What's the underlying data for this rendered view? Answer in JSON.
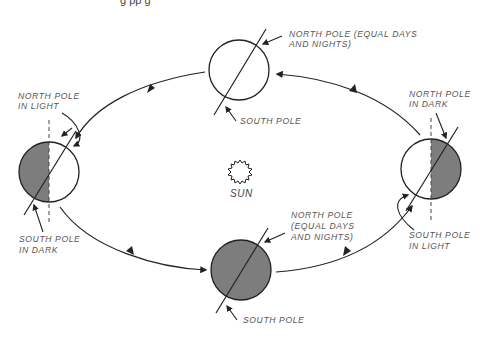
{
  "header": {
    "cut_off_text": "g  pp g"
  },
  "sun": {
    "label": "SUN"
  },
  "positions": {
    "top": {
      "north_label": [
        "NORTH POLE (EQUAL DAYS",
        "AND NIGHTS)"
      ],
      "south_label": [
        "SOUTH POLE"
      ],
      "fill": "none"
    },
    "left": {
      "north_label": [
        "NORTH POLE",
        "IN LIGHT"
      ],
      "south_label": [
        "SOUTH POLE",
        "IN DARK"
      ],
      "fill": "left-half-dark"
    },
    "right": {
      "north_label": [
        "NORTH POLE",
        "IN DARK"
      ],
      "south_label": [
        "SOUTH POLE",
        "IN LIGHT"
      ],
      "fill": "right-half-dark"
    },
    "bottom": {
      "north_label": [
        "NORTH POLE",
        "(EQUAL DAYS",
        "AND NIGHTS)"
      ],
      "south_label": [
        "SOUTH POLE"
      ],
      "fill": "full-dark"
    }
  },
  "colors": {
    "shade": "#7d7d7d",
    "stroke": "#222222",
    "text": "#555555"
  }
}
